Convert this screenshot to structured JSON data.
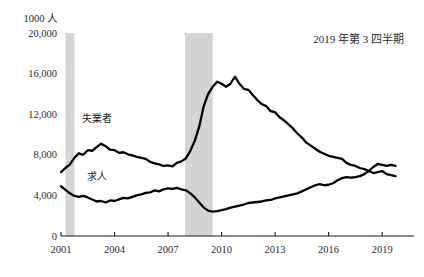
{
  "chart_data": {
    "type": "line",
    "title": "",
    "annotation": "2019 年第 3 四半期",
    "unit_label": "1000 人",
    "xlabel": "",
    "ylabel": "",
    "grid": false,
    "legend_position": "inline",
    "xlim": [
      2001.0,
      2020.0
    ],
    "ylim": [
      0,
      20000
    ],
    "x_ticks": [
      "2001",
      "2004",
      "2007",
      "2010",
      "2013",
      "2016",
      "2019"
    ],
    "x_tick_values": [
      2001,
      2004,
      2007,
      2010,
      2013,
      2016,
      2019
    ],
    "y_ticks": [
      "0",
      "4,000",
      "8,000",
      "12,000",
      "16,000",
      "20,000"
    ],
    "y_tick_values": [
      0,
      4000,
      8000,
      12000,
      16000,
      20000
    ],
    "shaded_regions": [
      {
        "name": "recession-2001",
        "x0": 2001.25,
        "x1": 2001.75,
        "color": "#d4d4d4"
      },
      {
        "name": "recession-2008",
        "x0": 2007.95,
        "x1": 2009.5,
        "color": "#d4d4d4"
      }
    ],
    "series": [
      {
        "name": "失業者",
        "label_x": 2003.0,
        "label_y": 11200,
        "color": "#000000",
        "x": [
          2001.0,
          2001.25,
          2001.5,
          2001.75,
          2002.0,
          2002.25,
          2002.5,
          2002.75,
          2003.0,
          2003.25,
          2003.5,
          2003.75,
          2004.0,
          2004.25,
          2004.5,
          2004.75,
          2005.0,
          2005.25,
          2005.5,
          2005.75,
          2006.0,
          2006.25,
          2006.5,
          2006.75,
          2007.0,
          2007.25,
          2007.5,
          2007.75,
          2008.0,
          2008.25,
          2008.5,
          2008.75,
          2009.0,
          2009.25,
          2009.5,
          2009.75,
          2010.0,
          2010.25,
          2010.5,
          2010.75,
          2011.0,
          2011.25,
          2011.5,
          2011.75,
          2012.0,
          2012.25,
          2012.5,
          2012.75,
          2013.0,
          2013.25,
          2013.5,
          2013.75,
          2014.0,
          2014.25,
          2014.5,
          2014.75,
          2015.0,
          2015.25,
          2015.5,
          2015.75,
          2016.0,
          2016.25,
          2016.5,
          2016.75,
          2017.0,
          2017.25,
          2017.5,
          2017.75,
          2018.0,
          2018.25,
          2018.5,
          2018.75,
          2019.0,
          2019.25,
          2019.5,
          2019.75
        ],
        "y": [
          6300,
          6700,
          7050,
          7700,
          8150,
          8000,
          8450,
          8400,
          8750,
          9100,
          8850,
          8500,
          8450,
          8200,
          8250,
          8050,
          7950,
          7800,
          7700,
          7600,
          7300,
          7150,
          7050,
          6900,
          6950,
          6850,
          7200,
          7350,
          7650,
          8400,
          9400,
          10800,
          12800,
          14000,
          14700,
          15200,
          15000,
          14700,
          15000,
          15700,
          15000,
          14500,
          14400,
          13900,
          13400,
          13000,
          12800,
          12300,
          12200,
          11700,
          11400,
          11000,
          10600,
          10100,
          9700,
          9200,
          8900,
          8600,
          8300,
          8100,
          7900,
          7800,
          7700,
          7600,
          7200,
          7000,
          6900,
          6700,
          6600,
          6400,
          6200,
          6300,
          6400,
          6100,
          6000,
          5900
        ]
      },
      {
        "name": "求人",
        "label_x": 2003.0,
        "label_y": 5500,
        "color": "#000000",
        "x": [
          2001.0,
          2001.25,
          2001.5,
          2001.75,
          2002.0,
          2002.25,
          2002.5,
          2002.75,
          2003.0,
          2003.25,
          2003.5,
          2003.75,
          2004.0,
          2004.25,
          2004.5,
          2004.75,
          2005.0,
          2005.25,
          2005.5,
          2005.75,
          2006.0,
          2006.25,
          2006.5,
          2006.75,
          2007.0,
          2007.25,
          2007.5,
          2007.75,
          2008.0,
          2008.25,
          2008.5,
          2008.75,
          2009.0,
          2009.25,
          2009.5,
          2009.75,
          2010.0,
          2010.25,
          2010.5,
          2010.75,
          2011.0,
          2011.25,
          2011.5,
          2011.75,
          2012.0,
          2012.25,
          2012.5,
          2012.75,
          2013.0,
          2013.25,
          2013.5,
          2013.75,
          2014.0,
          2014.25,
          2014.5,
          2014.75,
          2015.0,
          2015.25,
          2015.5,
          2015.75,
          2016.0,
          2016.25,
          2016.5,
          2016.75,
          2017.0,
          2017.25,
          2017.5,
          2017.75,
          2018.0,
          2018.25,
          2018.5,
          2018.75,
          2019.0,
          2019.25,
          2019.5,
          2019.75
        ],
        "y": [
          4900,
          4550,
          4200,
          3950,
          3850,
          3950,
          3800,
          3600,
          3400,
          3450,
          3300,
          3500,
          3450,
          3600,
          3750,
          3700,
          3850,
          4000,
          4100,
          4250,
          4300,
          4500,
          4400,
          4600,
          4700,
          4650,
          4750,
          4600,
          4500,
          4200,
          3800,
          3300,
          2800,
          2500,
          2400,
          2450,
          2550,
          2650,
          2800,
          2900,
          3000,
          3100,
          3250,
          3300,
          3350,
          3400,
          3500,
          3550,
          3700,
          3800,
          3900,
          4000,
          4100,
          4200,
          4400,
          4600,
          4800,
          5000,
          5100,
          5000,
          5050,
          5200,
          5500,
          5700,
          5800,
          5750,
          5800,
          5900,
          6100,
          6400,
          6800,
          7100,
          7000,
          6900,
          7000,
          6900
        ]
      }
    ]
  },
  "axes": {
    "unit_top_label": "1000 人"
  }
}
